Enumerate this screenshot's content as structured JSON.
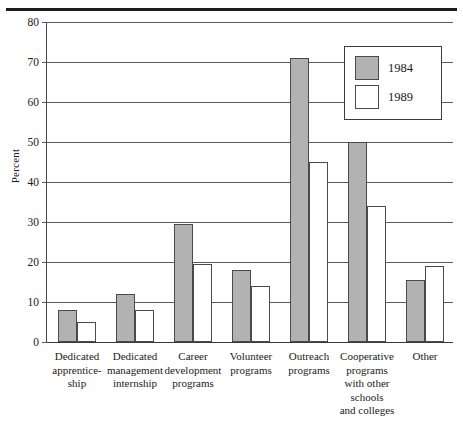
{
  "figure": {
    "rule_top": "horizontal-rule"
  },
  "axes": {
    "ylabel": "Percent",
    "yticks": [
      "0",
      "10",
      "20",
      "30",
      "40",
      "50",
      "60",
      "70",
      "80"
    ]
  },
  "legend": {
    "entries": [
      {
        "label": "1984",
        "color": "#b2b2b2",
        "swatch": "filled-gray-swatch"
      },
      {
        "label": "1989",
        "color": "#ffffff",
        "swatch": "empty-white-swatch"
      }
    ]
  },
  "chart_data": {
    "type": "bar",
    "title": "",
    "subtitle": "",
    "xlabel": "",
    "ylabel": "Percent",
    "ylim": [
      0,
      80
    ],
    "yticks": [
      0,
      10,
      20,
      30,
      40,
      50,
      60,
      70,
      80
    ],
    "grid": true,
    "legend_position": "upper-right-inside",
    "categories": [
      "Dedicated apprentice-ship",
      "Dedicated management internship",
      "Career development programs",
      "Volunteer programs",
      "Outreach programs",
      "Cooperative programs with other schools and colleges",
      "Other"
    ],
    "category_lines": [
      [
        "Dedicated",
        "apprentice-",
        "ship"
      ],
      [
        "Dedicated",
        "management",
        "internship"
      ],
      [
        "Career",
        "development",
        "programs"
      ],
      [
        "Volunteer",
        "programs"
      ],
      [
        "Outreach",
        "programs"
      ],
      [
        "Cooperative",
        "programs",
        "with other",
        "schools",
        "and colleges"
      ],
      [
        "Other"
      ]
    ],
    "series": [
      {
        "name": "1984",
        "color": "#b2b2b2",
        "values": [
          8,
          12,
          29.5,
          18,
          71,
          50,
          15.5
        ]
      },
      {
        "name": "1989",
        "color": "#ffffff",
        "values": [
          5,
          8,
          19.5,
          14,
          45,
          34,
          19
        ]
      }
    ]
  }
}
